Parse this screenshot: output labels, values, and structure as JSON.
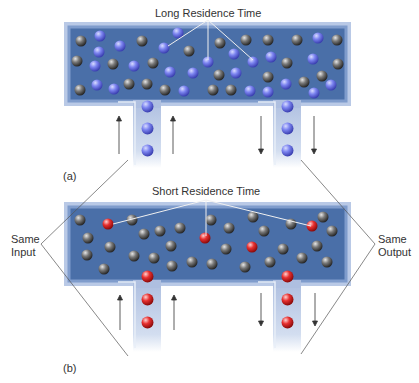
{
  "panel_a": {
    "label": "(a)",
    "annotation": "Long Residence Time",
    "ball_color": "blue",
    "marked_balls_note": "blue particles indicated"
  },
  "panel_b": {
    "label": "(b)",
    "annotation": "Short Residence Time",
    "ball_color": "red",
    "marked_balls_note": "red particles indicated"
  },
  "side_labels": {
    "input": [
      "Same",
      "Input"
    ],
    "output": [
      "Same",
      "Output"
    ]
  },
  "colors": {
    "tank_fill": "#4a6fa8",
    "tank_border": "#b9c9e6",
    "pipe_fill": "#c9d6ec",
    "blue_ball": "#6f78e8",
    "gray_ball": "#6b6b6b",
    "red_ball": "#e02a2a",
    "text": "#333333"
  }
}
